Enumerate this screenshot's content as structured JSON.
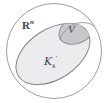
{
  "figure": {
    "kind": "set-containment-venn-diagram",
    "background_color": "#ffffff",
    "stroke_color": "#8a8a90",
    "ambient_sets": {
      "outer": {
        "name": "ambient-space-circle",
        "label_base": "R",
        "label_superscript": "n",
        "label_full": "Rⁿ",
        "fill": "#ffffff",
        "stroke": "#9a9aa0",
        "cx": 54,
        "cy": 51,
        "rx": 48,
        "ry": 47
      },
      "middle": {
        "name": "cone-set-ellipse",
        "label_base": "K",
        "label_subscript": "k",
        "label_prime": "′",
        "label_full": "𝒦ₖ′",
        "fill": "#ededef",
        "stroke": "#86868c",
        "cx": 53,
        "cy": 54,
        "rx": 41,
        "ry": 25,
        "rotation_deg": -33
      },
      "inner": {
        "name": "subset-region-v",
        "label_base": "V",
        "label_full": "V",
        "fill": "#c9c9cd",
        "stroke": "#8e8e94",
        "cx": 76,
        "cy": 31,
        "rx": 17,
        "ry": 12,
        "rotation_deg": -28
      }
    },
    "labels": {
      "ambient": "R",
      "ambient_sup": "n",
      "cone": "K",
      "cone_sub": "k",
      "cone_prime": "′",
      "subset": "V"
    }
  }
}
